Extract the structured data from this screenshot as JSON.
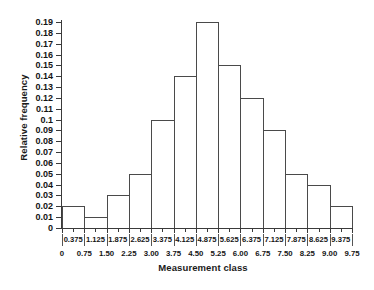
{
  "chart_data": {
    "type": "bar",
    "title": "",
    "xlabel": "Measurement class",
    "ylabel": "Relative frequency",
    "categories": [
      "0.375",
      "1.125",
      "1.875",
      "2.625",
      "3.375",
      "4.125",
      "4.875",
      "5.625",
      "6.375",
      "7.125",
      "7.875",
      "8.625",
      "9.375"
    ],
    "values": [
      0.02,
      0.01,
      0.03,
      0.05,
      0.1,
      0.14,
      0.19,
      0.15,
      0.12,
      0.09,
      0.05,
      0.04,
      0.02
    ],
    "bin_edges": [
      "0",
      "0.75",
      "1.50",
      "2.25",
      "3.00",
      "3.75",
      "4.50",
      "5.25",
      "6.00",
      "6.75",
      "7.50",
      "8.25",
      "9.00",
      "9.75"
    ],
    "bin_width": 0.75,
    "xlim": [
      0,
      9.75
    ],
    "ylim": [
      0,
      0.19
    ],
    "ytick_labels": [
      "0",
      "0.01",
      "0.02",
      "0.03",
      "0.04",
      "0.05",
      "0.06",
      "0.07",
      "0.08",
      "0.09",
      "0.1",
      "0.11",
      "0.12",
      "0.13",
      "0.14",
      "0.15",
      "0.16",
      "0.17",
      "0.18",
      "0.19"
    ],
    "ytick_values": [
      0,
      0.01,
      0.02,
      0.03,
      0.04,
      0.05,
      0.06,
      0.07,
      0.08,
      0.09,
      0.1,
      0.11,
      0.12,
      0.13,
      0.14,
      0.15,
      0.16,
      0.17,
      0.18,
      0.19
    ],
    "grid": false,
    "legend": null,
    "bar_fill": "#ffffff",
    "bar_stroke": "#4a4a4a",
    "axis_color": "#3a3a3a"
  }
}
